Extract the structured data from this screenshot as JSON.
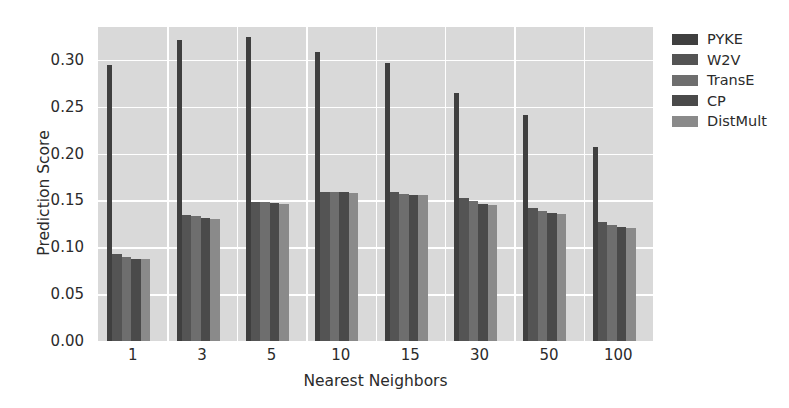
{
  "chart_data": {
    "type": "bar",
    "title": "",
    "xlabel": "Nearest Neighbors",
    "ylabel": "Prediction Score",
    "categories": [
      "1",
      "3",
      "5",
      "10",
      "15",
      "30",
      "50",
      "100"
    ],
    "ylim": [
      0.0,
      0.335
    ],
    "yticks": [
      0.0,
      0.05,
      0.1,
      0.15,
      0.2,
      0.25,
      0.3
    ],
    "ytick_labels": [
      "0.00",
      "0.05",
      "0.10",
      "0.15",
      "0.20",
      "0.25",
      "0.30"
    ],
    "grid": true,
    "legend_position": "right",
    "series": [
      {
        "name": "PYKE",
        "color": "#3f3f3f",
        "values": [
          0.295,
          0.321,
          0.324,
          0.308,
          0.297,
          0.265,
          0.241,
          0.207
        ]
      },
      {
        "name": "W2V",
        "color": "#545454",
        "values": [
          0.093,
          0.134,
          0.148,
          0.159,
          0.159,
          0.153,
          0.142,
          0.127
        ]
      },
      {
        "name": "TransE",
        "color": "#6e6e6e",
        "values": [
          0.09,
          0.133,
          0.148,
          0.159,
          0.157,
          0.149,
          0.139,
          0.124
        ]
      },
      {
        "name": "CP",
        "color": "#4a4a4a",
        "values": [
          0.088,
          0.131,
          0.147,
          0.159,
          0.156,
          0.146,
          0.137,
          0.122
        ]
      },
      {
        "name": "DistMult",
        "color": "#8a8a8a",
        "values": [
          0.087,
          0.13,
          0.146,
          0.158,
          0.156,
          0.145,
          0.136,
          0.121
        ]
      }
    ]
  },
  "axes": {
    "background_color": "#d9d9d9",
    "grid_color": "#ffffff",
    "text_color": "#2b2b2b"
  },
  "legend": {
    "entries": [
      "PYKE",
      "W2V",
      "TransE",
      "CP",
      "DistMult"
    ]
  }
}
